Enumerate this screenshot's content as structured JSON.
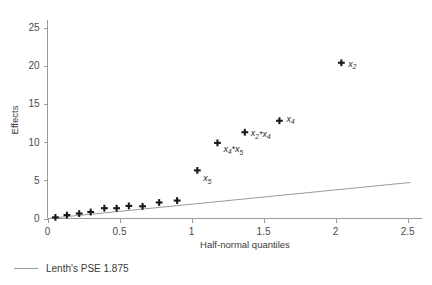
{
  "chart_data": {
    "type": "scatter",
    "title": "",
    "xlabel": "Half-normal quantiles",
    "ylabel": "Effects",
    "xlim": [
      0,
      2.6
    ],
    "ylim": [
      0,
      26
    ],
    "xticks": [
      0,
      0.5,
      1,
      1.5,
      2,
      2.5
    ],
    "xtick_labels": [
      "0",
      "0.5",
      "1",
      "1.5",
      "2",
      "2.5"
    ],
    "yticks": [
      0,
      5,
      10,
      15,
      20,
      25
    ],
    "ytick_labels": [
      "0",
      "5",
      "10",
      "15",
      "20",
      "25"
    ],
    "grid": false,
    "legend_position": "below-left",
    "points": [
      {
        "x": 0.055,
        "y": 0.15,
        "label": ""
      },
      {
        "x": 0.135,
        "y": 0.45,
        "label": ""
      },
      {
        "x": 0.22,
        "y": 0.65,
        "label": ""
      },
      {
        "x": 0.3,
        "y": 0.85,
        "label": ""
      },
      {
        "x": 0.395,
        "y": 1.35,
        "label": ""
      },
      {
        "x": 0.48,
        "y": 1.35,
        "label": ""
      },
      {
        "x": 0.565,
        "y": 1.65,
        "label": ""
      },
      {
        "x": 0.66,
        "y": 1.6,
        "label": ""
      },
      {
        "x": 0.775,
        "y": 2.1,
        "label": ""
      },
      {
        "x": 0.9,
        "y": 2.35,
        "label": ""
      },
      {
        "x": 1.04,
        "y": 6.3,
        "label": "x5"
      },
      {
        "x": 1.18,
        "y": 9.9,
        "label": "x4*x5"
      },
      {
        "x": 1.37,
        "y": 11.3,
        "label": "x2*x4"
      },
      {
        "x": 1.61,
        "y": 12.8,
        "label": "x4"
      },
      {
        "x": 2.04,
        "y": 20.4,
        "label": "x2"
      }
    ],
    "reference_line": {
      "name": "Lenth's PSE 1.875",
      "slope": 1.875,
      "x_start": 0.0,
      "y_start": 0.0,
      "x_end": 2.52,
      "y_end": 4.72
    },
    "colors": {
      "marker": "#1a1a1a",
      "axis": "#9a9a9a",
      "reference_line": "#9a9a9a",
      "text": "#3a3a3a"
    }
  },
  "legend": {
    "entries": [
      {
        "label": "Lenth's PSE 1.875",
        "swatch": "line"
      }
    ]
  },
  "point_labels": {
    "x5": {
      "base": "x",
      "sub": "5"
    },
    "x4x5": {
      "base": "x",
      "sub": "4",
      "op": "*",
      "base2": "x",
      "sub2": "5"
    },
    "x2x4": {
      "base": "x",
      "sub": "2",
      "op": "*",
      "base2": "x",
      "sub2": "4"
    },
    "x4": {
      "base": "x",
      "sub": "4"
    },
    "x2": {
      "base": "x",
      "sub": "2"
    }
  }
}
